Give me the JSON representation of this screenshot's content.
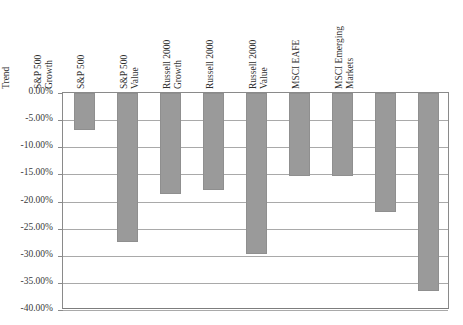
{
  "top_clipped_text": "",
  "chart_data": {
    "type": "bar",
    "title": "",
    "xlabel": "",
    "ylabel": "",
    "ylim": [
      -40,
      0
    ],
    "grid": true,
    "legend": "none",
    "orientation": "vertical",
    "bar_color": "#9a9a9a",
    "value_format": "percent",
    "categories": [
      "Dance with the Trend",
      "S&P 500 Growth",
      "S&P 500",
      "S&P 500 Value",
      "Russell 2000 Growth",
      "Russell 2000",
      "Russell 2000 Value",
      "MSCI EAFE",
      "MSCI Emerging Markets"
    ],
    "category_lines": [
      [
        "Dance with the",
        "Trend"
      ],
      [
        "S&P 500",
        "Growth"
      ],
      [
        "S&P 500"
      ],
      [
        "S&P 500",
        "Value"
      ],
      [
        "Russell 2000",
        "Growth"
      ],
      [
        "Russell 2000"
      ],
      [
        "Russell 2000",
        "Value"
      ],
      [
        "MSCI EAFE"
      ],
      [
        "MSCI Emerging",
        "Markets"
      ]
    ],
    "values": [
      -6.85,
      -27.4,
      -18.6,
      -17.9,
      -29.6,
      -15.3,
      -15.3,
      -22.0,
      -36.5
    ],
    "ytick_values": [
      0,
      -5,
      -10,
      -15,
      -20,
      -25,
      -30,
      -35,
      -40
    ],
    "ytick_labels": [
      "0.00%",
      "-5.00%",
      "-10.00%",
      "-15.00%",
      "-20.00%",
      "-25.00%",
      "-30.00%",
      "-35.00%",
      "-40.00%"
    ]
  }
}
